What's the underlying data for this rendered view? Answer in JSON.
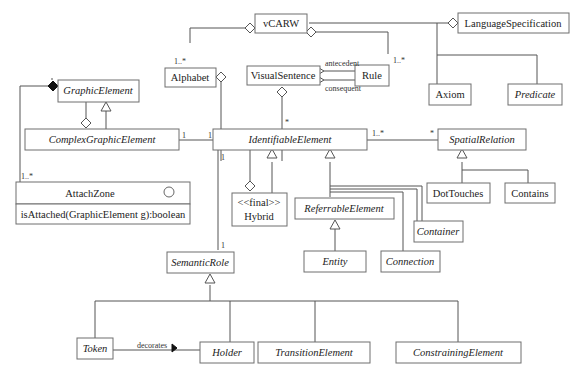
{
  "diagram": {
    "type": "uml-class-diagram",
    "classes": {
      "vcarw": {
        "name": "vCARW",
        "abstract": false
      },
      "language_specification": {
        "name": "LanguageSpecification",
        "abstract": false
      },
      "alphabet": {
        "name": "Alphabet",
        "abstract": false
      },
      "visual_sentence": {
        "name": "VisualSentence",
        "abstract": false
      },
      "rule": {
        "name": "Rule",
        "abstract": false
      },
      "axiom": {
        "name": "Axiom",
        "abstract": false
      },
      "predicate": {
        "name": "Predicate",
        "abstract": true
      },
      "graphic_element": {
        "name": "GraphicElement",
        "abstract": true
      },
      "complex_graphic_element": {
        "name": "ComplexGraphicElement",
        "abstract": true
      },
      "identifiable_element": {
        "name": "IdentifiableElement",
        "abstract": true
      },
      "spatial_relation": {
        "name": "SpatialRelation",
        "abstract": true
      },
      "attach_zone": {
        "name": "AttachZone",
        "abstract": false,
        "operation": "isAttached(GraphicElement g):boolean"
      },
      "hybrid": {
        "name": "Hybrid",
        "stereotype": "<<final>>",
        "abstract": false
      },
      "referrable_element": {
        "name": "ReferrableElement",
        "abstract": true
      },
      "container": {
        "name": "Container",
        "abstract": true
      },
      "entity": {
        "name": "Entity",
        "abstract": true
      },
      "connection": {
        "name": "Connection",
        "abstract": true
      },
      "dot_touches": {
        "name": "DotTouches",
        "abstract": false
      },
      "contains": {
        "name": "Contains",
        "abstract": false
      },
      "semantic_role": {
        "name": "SemanticRole",
        "abstract": true
      },
      "token": {
        "name": "Token",
        "abstract": true
      },
      "holder": {
        "name": "Holder",
        "abstract": true
      },
      "transition_element": {
        "name": "TransitionElement",
        "abstract": true
      },
      "constraining_element": {
        "name": "ConstrainingElement",
        "abstract": true
      }
    },
    "labels": {
      "antecedent": "antecedent",
      "consequent": "consequent",
      "decorates": "decorates",
      "mult_alphabet": "1..*",
      "mult_rule": "1..*",
      "mult_visual_sentence": "*",
      "mult_cge": "1",
      "mult_ie_left": "1",
      "mult_ie_right": "1..*",
      "mult_sr": "*",
      "mult_ie_down": "1",
      "mult_sem_role": "1",
      "mult_attach_zone": "1..*"
    },
    "relationships": [
      {
        "from": "vCARW",
        "to": "Alphabet",
        "kind": "aggregation",
        "multiplicity": "1..*"
      },
      {
        "from": "vCARW",
        "to": "LanguageSpecification",
        "kind": "association-aggregation"
      },
      {
        "from": "vCARW",
        "to": "Rule",
        "kind": "aggregation",
        "multiplicity": "1..*"
      },
      {
        "from": "LanguageSpecification",
        "to": "Axiom",
        "kind": "generalization"
      },
      {
        "from": "LanguageSpecification",
        "to": "Predicate",
        "kind": "generalization"
      },
      {
        "from": "Rule",
        "to": "VisualSentence",
        "kind": "association",
        "role": "antecedent"
      },
      {
        "from": "Rule",
        "to": "VisualSentence",
        "kind": "association",
        "role": "consequent"
      },
      {
        "from": "Alphabet",
        "to": "IdentifiableElement",
        "kind": "aggregation"
      },
      {
        "from": "VisualSentence",
        "to": "IdentifiableElement",
        "kind": "aggregation",
        "multiplicity": "*"
      },
      {
        "from": "GraphicElement",
        "to": "AttachZone",
        "kind": "composition",
        "multiplicity": "1..*"
      },
      {
        "from": "GraphicElement",
        "to": "ComplexGraphicElement",
        "kind": "aggregation"
      },
      {
        "from": "ComplexGraphicElement",
        "to": "GraphicElement",
        "kind": "generalization"
      },
      {
        "from": "ComplexGraphicElement",
        "to": "IdentifiableElement",
        "kind": "association",
        "multiplicity": "1 - 1"
      },
      {
        "from": "IdentifiableElement",
        "to": "SpatialRelation",
        "kind": "association",
        "multiplicity": "1..* - *"
      },
      {
        "from": "Hybrid",
        "to": "IdentifiableElement",
        "kind": "generalization"
      },
      {
        "from": "IdentifiableElement",
        "to": "Hybrid",
        "kind": "aggregation"
      },
      {
        "from": "ReferrableElement",
        "to": "IdentifiableElement",
        "kind": "generalization"
      },
      {
        "from": "Container",
        "to": "IdentifiableElement",
        "kind": "generalization"
      },
      {
        "from": "Connection",
        "to": "IdentifiableElement",
        "kind": "generalization"
      },
      {
        "from": "Entity",
        "to": "ReferrableElement",
        "kind": "generalization"
      },
      {
        "from": "DotTouches",
        "to": "SpatialRelation",
        "kind": "generalization"
      },
      {
        "from": "Contains",
        "to": "SpatialRelation",
        "kind": "generalization"
      },
      {
        "from": "IdentifiableElement",
        "to": "SemanticRole",
        "kind": "association",
        "multiplicity": "1 - 1"
      },
      {
        "from": "Token",
        "to": "SemanticRole",
        "kind": "generalization"
      },
      {
        "from": "Holder",
        "to": "SemanticRole",
        "kind": "generalization"
      },
      {
        "from": "TransitionElement",
        "to": "SemanticRole",
        "kind": "generalization"
      },
      {
        "from": "ConstrainingElement",
        "to": "SemanticRole",
        "kind": "generalization"
      },
      {
        "from": "Token",
        "to": "Holder",
        "kind": "association",
        "role": "decorates"
      }
    ]
  }
}
